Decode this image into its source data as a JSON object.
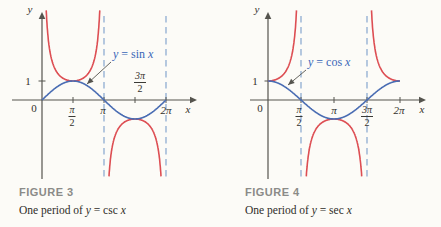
{
  "palette": {
    "blue_curve": "#4a6db3",
    "red_curve": "#dd4e53",
    "dashed_asymptote": "#97b2d4",
    "axis": "#55544e",
    "text": "#33312c",
    "figure_label_gray": "#8b8b88",
    "label_blue": "#3a66b8",
    "background": "#fcfbf7"
  },
  "figures": [
    {
      "id": "fig3",
      "figure_label": "FIGURE 3",
      "caption": {
        "p1": "One period of ",
        "v1": "y",
        "p2": " = csc ",
        "v2": "x"
      },
      "curve_label": {
        "v1": "y",
        "p": " = sin ",
        "v2": "x"
      },
      "axis_x_label": "x",
      "axis_y_label": "y",
      "origin_label": "0",
      "y_tick_label": "1",
      "x_ticks": [
        {
          "type": "fraction",
          "num": "π",
          "den": "2"
        },
        {
          "type": "plain",
          "label": "π"
        },
        {
          "type": "fraction",
          "num": "3π",
          "den": "2"
        },
        {
          "type": "plain",
          "label": "2π"
        }
      ],
      "blue_fn": "sin",
      "red_fn": "csc",
      "geometry": {
        "ox": 42,
        "oy": 100,
        "unit": 31,
        "amp": 19,
        "x_start": 12,
        "x_end": 197,
        "y_top": 12,
        "y_bottom": 179,
        "clip_top": 8,
        "clip_bottom": 179,
        "dash_top": 16,
        "dash_bottom": 181,
        "asymptotes": [
          2,
          4
        ],
        "x_tick_pos": [
          1,
          2,
          3,
          4
        ],
        "pointer": {
          "x1": 111,
          "y1": 62,
          "x2": 87,
          "y2": 84
        }
      }
    },
    {
      "id": "fig4",
      "figure_label": "FIGURE 4",
      "caption": {
        "p1": "One period of ",
        "v1": "y",
        "p2": " = sec ",
        "v2": "x"
      },
      "curve_label": {
        "v1": "y",
        "p": " = cos ",
        "v2": "x"
      },
      "axis_x_label": "x",
      "axis_y_label": "y",
      "origin_label": "0",
      "y_tick_label": "1",
      "x_ticks": [
        {
          "type": "fraction",
          "num": "π",
          "den": "2"
        },
        {
          "type": "plain",
          "label": "π"
        },
        {
          "type": "fraction",
          "num": "3π",
          "den": "2"
        },
        {
          "type": "plain",
          "label": "2π"
        }
      ],
      "blue_fn": "cos",
      "red_fn": "sec",
      "geometry": {
        "ox": 268,
        "oy": 100,
        "unit": 33,
        "amp": 19,
        "x_start": 250,
        "x_end": 426,
        "y_top": 12,
        "y_bottom": 179,
        "clip_top": 8,
        "clip_bottom": 179,
        "dash_top": 16,
        "dash_bottom": 181,
        "asymptotes": [
          1,
          3
        ],
        "x_tick_pos": [
          1,
          2,
          3,
          4
        ],
        "pointer": {
          "x1": 306,
          "y1": 70,
          "x2": 288,
          "y2": 85
        }
      }
    }
  ],
  "chart_data": [
    {
      "type": "line",
      "title": "FIGURE 3",
      "caption": "One period of y = csc x",
      "xlabel": "x",
      "ylabel": "y",
      "x_ticks": [
        "0",
        "π/2",
        "π",
        "3π/2",
        "2π"
      ],
      "y_ticks": [
        1
      ],
      "x_domain_rad": [
        0,
        6.2832
      ],
      "asymptotes_dashed": [
        "x = π",
        "x = 2π"
      ],
      "grid": false,
      "annotation": {
        "text": "y = sin x",
        "points_to": "sine curve"
      },
      "x_samples_in_pi_units": [
        0,
        0.25,
        0.5,
        0.75,
        1,
        1.25,
        1.5,
        1.75,
        2
      ],
      "series": [
        {
          "name": "y = sin x",
          "color_role": "blue_curve",
          "values": [
            0,
            0.7071,
            1,
            0.7071,
            0,
            -0.7071,
            -1,
            -0.7071,
            0
          ]
        },
        {
          "name": "y = csc x",
          "color_role": "red_curve",
          "values": [
            null,
            1.4142,
            1,
            1.4142,
            null,
            -1.4142,
            -1,
            -1.4142,
            null
          ]
        }
      ]
    },
    {
      "type": "line",
      "title": "FIGURE 4",
      "caption": "One period of y = sec x",
      "xlabel": "x",
      "ylabel": "y",
      "x_ticks": [
        "0",
        "π/2",
        "π",
        "3π/2",
        "2π"
      ],
      "y_ticks": [
        1
      ],
      "x_domain_rad": [
        0,
        6.2832
      ],
      "asymptotes_dashed": [
        "x = π/2",
        "x = 3π/2"
      ],
      "grid": false,
      "annotation": {
        "text": "y = cos x",
        "points_to": "cosine curve"
      },
      "x_samples_in_pi_units": [
        0,
        0.25,
        0.5,
        0.75,
        1,
        1.25,
        1.5,
        1.75,
        2
      ],
      "series": [
        {
          "name": "y = cos x",
          "color_role": "blue_curve",
          "values": [
            1,
            0.7071,
            0,
            -0.7071,
            -1,
            -0.7071,
            0,
            0.7071,
            1
          ]
        },
        {
          "name": "y = sec x",
          "color_role": "red_curve",
          "values": [
            1,
            1.4142,
            null,
            -1.4142,
            -1,
            -1.4142,
            null,
            1.4142,
            1
          ]
        }
      ]
    }
  ]
}
